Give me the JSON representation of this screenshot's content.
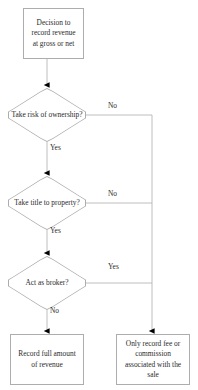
{
  "diagram": {
    "type": "flowchart",
    "colors": {
      "stroke": "#adadad",
      "text": "#2b2b2b",
      "fill": "#ffffff",
      "arrowhead": "#000000"
    },
    "nodes": {
      "start": {
        "shape": "process",
        "label": "Decision to record revenue at gross or net"
      },
      "risk": {
        "shape": "decision",
        "label": "Take risk of ownership?"
      },
      "title": {
        "shape": "decision",
        "label": "Take title to property?"
      },
      "broker": {
        "shape": "decision",
        "label": "Act as broker?"
      },
      "record_full": {
        "shape": "process",
        "label": "Record full amount of revenue"
      },
      "record_fee": {
        "shape": "process",
        "label": "Only record fee or commission associated with the sale"
      }
    },
    "edges": [
      {
        "from": "start",
        "to": "risk",
        "label": ""
      },
      {
        "from": "risk",
        "to": "record_fee",
        "label": "No"
      },
      {
        "from": "risk",
        "to": "title",
        "label": "Yes"
      },
      {
        "from": "title",
        "to": "record_fee",
        "label": "No"
      },
      {
        "from": "title",
        "to": "broker",
        "label": "Yes"
      },
      {
        "from": "broker",
        "to": "record_fee",
        "label": "Yes"
      },
      {
        "from": "broker",
        "to": "record_full",
        "label": "No"
      }
    ],
    "edge_labels": {
      "risk_no": "No",
      "risk_yes": "Yes",
      "title_no": "No",
      "title_yes": "Yes",
      "broker_yes": "Yes",
      "broker_no": "No"
    }
  }
}
